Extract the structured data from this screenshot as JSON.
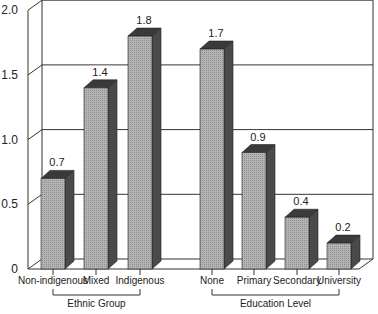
{
  "chart_data": {
    "type": "bar",
    "style": "3d-grouped",
    "title": "",
    "xlabel": "",
    "ylabel": "",
    "ylim": [
      0,
      2.0
    ],
    "yticks": [
      "0",
      "0.5",
      "1.0",
      "1.5",
      "2.0"
    ],
    "grid": true,
    "groups": [
      {
        "label": "Ethnic Group",
        "categories": [
          "Non-indigenous",
          "Mixed",
          "Indigenous"
        ],
        "values": [
          0.7,
          1.4,
          1.8
        ],
        "value_labels": [
          "0.7",
          "1.4",
          "1.8"
        ]
      },
      {
        "label": "Education Level",
        "categories": [
          "None",
          "Primary",
          "Secondary",
          "University"
        ],
        "values": [
          1.7,
          0.9,
          0.4,
          0.2
        ],
        "value_labels": [
          "1.7",
          "0.9",
          "0.4",
          "0.2"
        ]
      }
    ],
    "colors": {
      "bar_front": "#a9a9a9",
      "bar_side": "#4a4a4a",
      "bar_top": "#3a3a3a",
      "grid": "#333333"
    }
  }
}
